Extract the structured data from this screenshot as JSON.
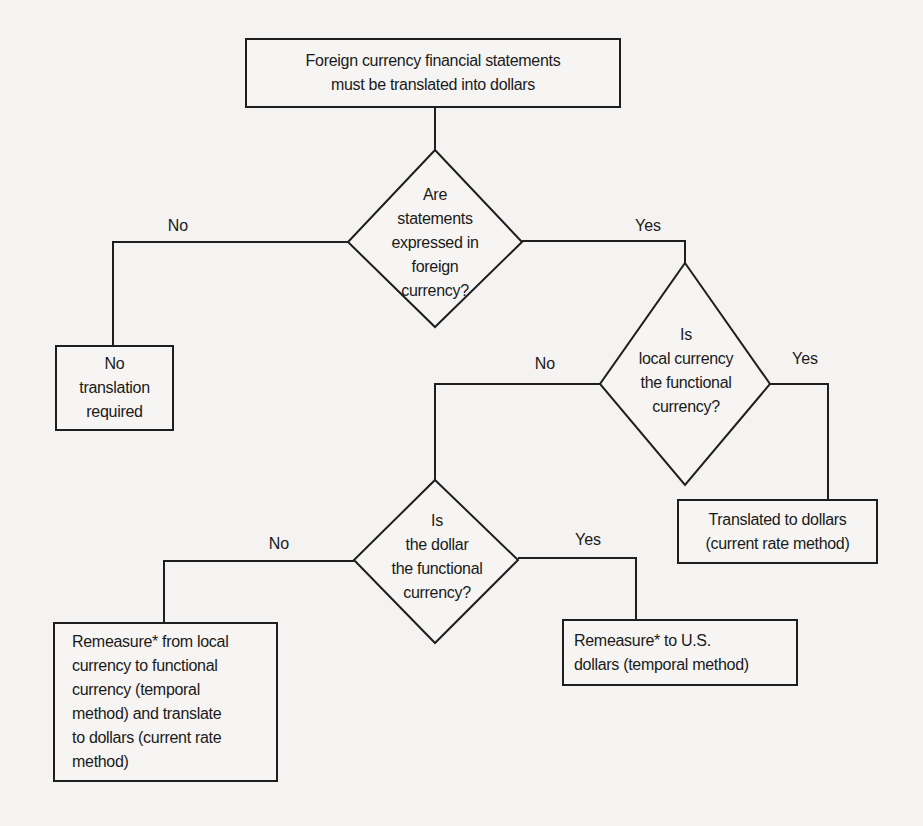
{
  "diagram": {
    "type": "flowchart",
    "start": {
      "lines": [
        "Foreign currency financial statements",
        "must be translated into dollars"
      ]
    },
    "decisions": [
      {
        "id": "d1",
        "lines": [
          "Are",
          "statements",
          "expressed in",
          "foreign",
          "currency?"
        ]
      },
      {
        "id": "d2",
        "lines": [
          "Is",
          "local currency",
          "the functional",
          "currency?"
        ]
      },
      {
        "id": "d3",
        "lines": [
          "Is",
          "the dollar",
          "the functional",
          "currency?"
        ]
      }
    ],
    "outcomes": [
      {
        "id": "o1",
        "lines": [
          "No",
          "translation",
          "required"
        ]
      },
      {
        "id": "o2",
        "lines": [
          "Translated to dollars",
          "(current rate method)"
        ]
      },
      {
        "id": "o3",
        "lines": [
          "Remeasure* to U.S.",
          "dollars (temporal method)"
        ]
      },
      {
        "id": "o4",
        "lines": [
          "Remeasure* from local",
          "currency to functional",
          "currency (temporal",
          "method) and translate",
          "to dollars (current rate",
          "method)"
        ]
      }
    ],
    "edges": [
      {
        "from": "start",
        "to": "d1",
        "label": ""
      },
      {
        "from": "d1",
        "to": "o1",
        "label": "No"
      },
      {
        "from": "d1",
        "to": "d2",
        "label": "Yes"
      },
      {
        "from": "d2",
        "to": "d3",
        "label": "No"
      },
      {
        "from": "d2",
        "to": "o2",
        "label": "Yes"
      },
      {
        "from": "d3",
        "to": "o4",
        "label": "No"
      },
      {
        "from": "d3",
        "to": "o3",
        "label": "Yes"
      }
    ],
    "colors": {
      "line": "#1e1e1e",
      "background": "#f4f3f1",
      "text": "#1a1a1a"
    }
  }
}
